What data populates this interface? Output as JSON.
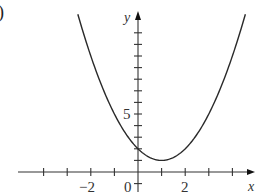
{
  "panel_label": ")",
  "chart_data": {
    "type": "line",
    "title": "",
    "xlabel": "x",
    "ylabel": "y",
    "function": "y = (x - 1)^2 + 1",
    "series": [
      {
        "name": "parabola",
        "x": [
          -2.55,
          -2,
          -1.5,
          -1,
          -0.5,
          0,
          0.5,
          1,
          1.5,
          2,
          2.5,
          3,
          3.5,
          4.55
        ],
        "y": [
          13.6,
          10,
          7.25,
          5,
          3.25,
          2,
          1.25,
          1,
          1.25,
          2,
          3.25,
          5,
          7.25,
          13.6
        ]
      }
    ],
    "vertex": [
      1,
      1
    ],
    "y_intercept": 2,
    "xlim": [
      -5,
      5
    ],
    "ylim": [
      -1.5,
      13.5
    ],
    "x_ticks": [
      -4,
      -3,
      -2,
      -1,
      1,
      2,
      3,
      4
    ],
    "x_tick_labels": [
      "-2",
      "2"
    ],
    "y_ticks": [
      1,
      2,
      3,
      4,
      5,
      6,
      7,
      8,
      9,
      10,
      11,
      12,
      -1
    ],
    "y_tick_labels": [
      "5"
    ],
    "origin_label": "0",
    "grid": false,
    "legend": null
  },
  "labels": {
    "x_axis": "x",
    "y_axis": "y",
    "origin": "0",
    "tick_neg2": "−2",
    "tick_2": "2",
    "tick_5": "5"
  }
}
